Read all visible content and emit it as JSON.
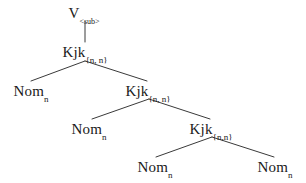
{
  "figure": {
    "type": "syntax-tree",
    "background_color": "#ffffff",
    "line_color": "#3a3a3a",
    "text_color": "#1a1a1a",
    "width": 306,
    "height": 183
  },
  "nodes": [
    {
      "id": "n0",
      "base": "V",
      "sub": "<sub>",
      "x": 84,
      "y": 6,
      "level": 0
    },
    {
      "id": "n1",
      "base": "Kjk",
      "sub": "{n, n}",
      "x": 85,
      "y": 45,
      "level": 1
    },
    {
      "id": "n2",
      "base": "Nom",
      "sub": "n",
      "x": 31,
      "y": 84,
      "level": 2
    },
    {
      "id": "n3",
      "base": "Kjk",
      "sub": "{n, n}",
      "x": 148,
      "y": 84,
      "level": 2
    },
    {
      "id": "n4",
      "base": "Nom",
      "sub": "n",
      "x": 89,
      "y": 122,
      "level": 3
    },
    {
      "id": "n5",
      "base": "Kjk",
      "sub": "{n,n}",
      "x": 211,
      "y": 122,
      "level": 3
    },
    {
      "id": "n6",
      "base": "Nom",
      "sub": "n",
      "x": 155,
      "y": 160,
      "level": 4
    },
    {
      "id": "n7",
      "base": "Nom",
      "sub": "n",
      "x": 275,
      "y": 160,
      "level": 4
    }
  ],
  "edges": [
    {
      "id": "e0",
      "from": "n0",
      "to": "n1",
      "x1": 85,
      "y1": 22,
      "x2": 85,
      "y2": 42,
      "kind": "vertical"
    },
    {
      "id": "e1",
      "from": "n1",
      "to": "n2",
      "x1": 85,
      "y1": 61,
      "x2": 31,
      "y2": 81,
      "kind": "left-branch"
    },
    {
      "id": "e2",
      "from": "n1",
      "to": "n3",
      "x1": 85,
      "y1": 61,
      "x2": 147,
      "y2": 81,
      "kind": "right-branch"
    },
    {
      "id": "e3",
      "from": "n3",
      "to": "n4",
      "x1": 149,
      "y1": 99,
      "x2": 92,
      "y2": 119,
      "kind": "left-branch"
    },
    {
      "id": "e4",
      "from": "n3",
      "to": "n5",
      "x1": 149,
      "y1": 99,
      "x2": 210,
      "y2": 119,
      "kind": "right-branch"
    },
    {
      "id": "e5",
      "from": "n5",
      "to": "n6",
      "x1": 212,
      "y1": 137,
      "x2": 156,
      "y2": 157,
      "kind": "left-branch"
    },
    {
      "id": "e6",
      "from": "n5",
      "to": "n7",
      "x1": 212,
      "y1": 137,
      "x2": 274,
      "y2": 157,
      "kind": "right-branch"
    }
  ],
  "chart_data": {
    "type": "tree",
    "title": "",
    "root": "V<sub>",
    "structure": [
      {
        "label": "V",
        "subscript": "<sub>",
        "depth": 0,
        "children": [
          "Kjk{n, n}"
        ]
      },
      {
        "label": "Kjk",
        "subscript": "{n, n}",
        "depth": 1,
        "children": [
          "Nom_n",
          "Kjk{n, n}"
        ]
      },
      {
        "label": "Nom",
        "subscript": "n",
        "depth": 2,
        "children": []
      },
      {
        "label": "Kjk",
        "subscript": "{n, n}",
        "depth": 2,
        "children": [
          "Nom_n",
          "Kjk{n,n}"
        ]
      },
      {
        "label": "Nom",
        "subscript": "n",
        "depth": 3,
        "children": []
      },
      {
        "label": "Kjk",
        "subscript": "{n,n}",
        "depth": 3,
        "children": [
          "Nom_n",
          "Nom_n"
        ]
      },
      {
        "label": "Nom",
        "subscript": "n",
        "depth": 4,
        "children": []
      },
      {
        "label": "Nom",
        "subscript": "n",
        "depth": 4,
        "children": []
      }
    ]
  }
}
